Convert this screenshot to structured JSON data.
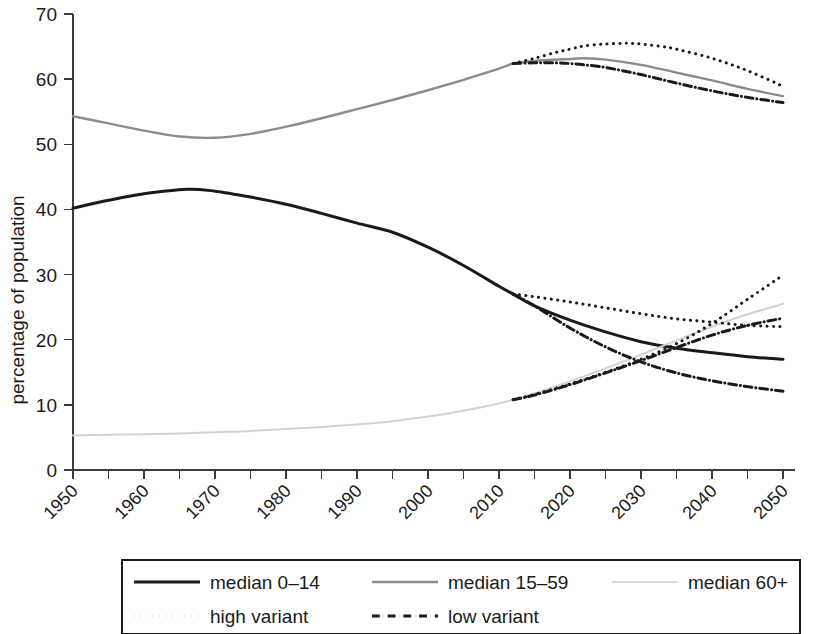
{
  "chart_data": {
    "type": "line",
    "title": "",
    "xlabel": "",
    "ylabel": "percentage of population",
    "xlim": [
      1950,
      2050
    ],
    "ylim": [
      0,
      70
    ],
    "grid": false,
    "legend_position": "bottom",
    "x_ticks": [
      1950,
      1960,
      1970,
      1980,
      1990,
      2000,
      2010,
      2020,
      2030,
      2040,
      2050
    ],
    "x_minor_ticks": [
      1955,
      1965,
      1975,
      1985,
      1995,
      2005,
      2015,
      2025,
      2035,
      2045
    ],
    "y_ticks": [
      0,
      10,
      20,
      30,
      40,
      50,
      60,
      70
    ],
    "projection_start": 2012,
    "series": [
      {
        "name": "median 0-14",
        "style": "solid",
        "color": "#1a1a1a",
        "width": 3.0,
        "x": [
          1950,
          1955,
          1960,
          1966,
          1970,
          1975,
          1980,
          1985,
          1990,
          1995,
          2000,
          2005,
          2010,
          2012,
          2015,
          2020,
          2025,
          2030,
          2035,
          2040,
          2045,
          2050
        ],
        "values": [
          40.2,
          41.4,
          42.4,
          43.1,
          42.8,
          41.9,
          40.8,
          39.4,
          37.9,
          36.5,
          34.2,
          31.4,
          28.2,
          27.0,
          25.2,
          23.0,
          21.2,
          19.7,
          18.7,
          18.0,
          17.4,
          17.0
        ]
      },
      {
        "name": "median 15-59",
        "style": "solid",
        "color": "#8c8c8c",
        "width": 2.4,
        "x": [
          1950,
          1955,
          1960,
          1965,
          1970,
          1975,
          1980,
          1985,
          1990,
          1995,
          2000,
          2005,
          2010,
          2012,
          2015,
          2020,
          2022,
          2025,
          2030,
          2035,
          2040,
          2045,
          2050
        ],
        "values": [
          54.3,
          53.2,
          52.1,
          51.2,
          51.0,
          51.6,
          52.7,
          54.0,
          55.4,
          56.8,
          58.3,
          59.9,
          61.6,
          62.4,
          62.8,
          63.1,
          63.2,
          63.0,
          62.2,
          61.0,
          59.8,
          58.5,
          57.4
        ]
      },
      {
        "name": "median 60+",
        "style": "solid",
        "color": "#d2d2d2",
        "width": 2.0,
        "x": [
          1950,
          1955,
          1960,
          1965,
          1970,
          1975,
          1980,
          1985,
          1990,
          1995,
          2000,
          2005,
          2010,
          2012,
          2015,
          2020,
          2025,
          2030,
          2035,
          2040,
          2045,
          2050
        ],
        "values": [
          5.3,
          5.4,
          5.5,
          5.6,
          5.8,
          6.0,
          6.3,
          6.6,
          7.0,
          7.5,
          8.2,
          9.1,
          10.2,
          10.8,
          11.8,
          13.6,
          15.6,
          17.7,
          19.9,
          22.0,
          23.9,
          25.5
        ]
      },
      {
        "name": "high variant 15-59",
        "style": "dotted",
        "color": "#1a1a1a",
        "width": 3.0,
        "group": "15-59",
        "x": [
          2012,
          2015,
          2018,
          2020,
          2022,
          2025,
          2028,
          2030,
          2033,
          2035,
          2040,
          2045,
          2050
        ],
        "values": [
          62.4,
          63.2,
          64.1,
          64.6,
          65.1,
          65.4,
          65.5,
          65.4,
          65.0,
          64.6,
          63.2,
          61.3,
          58.9
        ]
      },
      {
        "name": "low variant 15-59",
        "style": "dashdot",
        "color": "#1a1a1a",
        "width": 3.0,
        "group": "15-59",
        "x": [
          2012,
          2015,
          2018,
          2020,
          2022,
          2025,
          2030,
          2035,
          2040,
          2045,
          2050
        ],
        "values": [
          62.4,
          62.5,
          62.5,
          62.4,
          62.2,
          61.8,
          60.7,
          59.4,
          58.2,
          57.2,
          56.4
        ]
      },
      {
        "name": "high variant 0-14",
        "style": "dotted",
        "color": "#1a1a1a",
        "width": 3.0,
        "group": "0-14",
        "x": [
          2012,
          2015,
          2020,
          2025,
          2030,
          2035,
          2040,
          2045,
          2050
        ],
        "values": [
          27.0,
          26.6,
          25.8,
          24.9,
          24.0,
          23.2,
          22.7,
          22.2,
          22.0
        ]
      },
      {
        "name": "low variant 0-14",
        "style": "dashdot",
        "color": "#1a1a1a",
        "width": 3.0,
        "group": "0-14",
        "x": [
          2012,
          2015,
          2020,
          2025,
          2030,
          2035,
          2040,
          2045,
          2050
        ],
        "values": [
          27.0,
          25.2,
          21.8,
          18.9,
          16.6,
          14.9,
          13.7,
          12.8,
          12.1
        ]
      },
      {
        "name": "high variant 60+",
        "style": "dotted",
        "color": "#1a1a1a",
        "width": 3.0,
        "group": "60+",
        "x": [
          2012,
          2015,
          2020,
          2025,
          2030,
          2035,
          2040,
          2045,
          2050
        ],
        "values": [
          10.8,
          11.6,
          13.2,
          15.0,
          17.0,
          19.4,
          22.5,
          26.2,
          29.9
        ]
      },
      {
        "name": "low variant 60+",
        "style": "dashdot",
        "color": "#1a1a1a",
        "width": 3.0,
        "group": "60+",
        "x": [
          2012,
          2015,
          2020,
          2025,
          2030,
          2035,
          2040,
          2045,
          2050
        ],
        "values": [
          10.8,
          11.5,
          13.1,
          14.9,
          16.8,
          18.8,
          20.7,
          22.2,
          23.3
        ]
      }
    ],
    "legend": [
      {
        "label": "median 0–14",
        "style": "solid",
        "color": "#1a1a1a",
        "width": 3.0
      },
      {
        "label": "median 15–59",
        "style": "solid",
        "color": "#8c8c8c",
        "width": 2.6
      },
      {
        "label": "median 60+",
        "style": "solid",
        "color": "#dcdcdc",
        "width": 2.2
      },
      {
        "label": "high variant",
        "style": "dotted",
        "color": "#1a1a1a",
        "width": 3.0
      },
      {
        "label": "low variant",
        "style": "dashdot",
        "color": "#1a1a1a",
        "width": 3.0
      }
    ]
  }
}
